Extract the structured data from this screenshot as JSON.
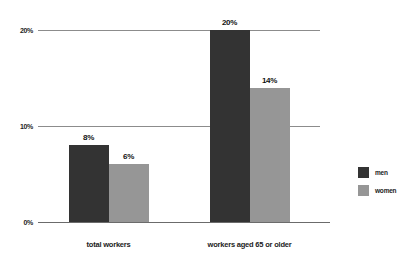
{
  "chart_data": {
    "type": "bar",
    "title": "",
    "subtitle": "",
    "xlabel": "",
    "ylabel": "",
    "categories": [
      "total workers",
      "workers aged 65 or older"
    ],
    "series": [
      {
        "name": "men",
        "color": "#333333",
        "values": [
          8,
          20
        ],
        "labels": [
          "8%",
          "20%"
        ]
      },
      {
        "name": "women",
        "color": "#969696",
        "values": [
          6,
          14
        ],
        "labels": [
          "6%",
          "14%"
        ]
      }
    ],
    "ylim": [
      0,
      20
    ],
    "yticks": [
      0,
      10,
      20
    ],
    "ytick_labels": [
      "0%",
      "10%",
      "20%"
    ],
    "grid": true,
    "legend_position": "right",
    "value_labels": true,
    "background_color": "#ffffff",
    "axis_color": "#8c8c8c"
  }
}
